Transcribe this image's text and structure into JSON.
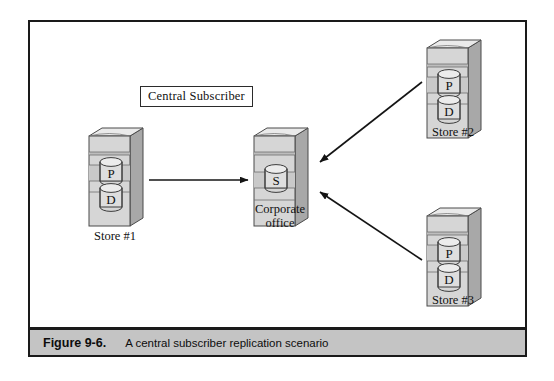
{
  "figure": {
    "caption_number": "Figure 9-6.",
    "caption_title": "A central subscriber replication scenario"
  },
  "diagram": {
    "type": "replication-topology",
    "title_box": "Central Subscriber",
    "colors": {
      "tower_front": "#d6d6d6",
      "tower_top": "#e8e8e8",
      "tower_side": "#a8a8a8",
      "tower_band": "#c3c3c3",
      "disk_face": "#dedede",
      "outline": "#4a4a4a",
      "arrow": "#141414",
      "caption_bar": "#c4c4c4",
      "frame_border": "#1a1a1a"
    },
    "nodes": [
      {
        "id": "store-1",
        "label": "Store #1",
        "role": "publisher",
        "disks": [
          "P",
          "D"
        ],
        "x": 55,
        "y": 100
      },
      {
        "id": "corporate-office",
        "label": "Corporate\noffice",
        "label_line_1": "Corporate",
        "label_line_2": "office",
        "role": "subscriber",
        "disks": [
          "S"
        ],
        "x": 220,
        "y": 100
      },
      {
        "id": "store-2",
        "label": "Store #2",
        "role": "publisher",
        "disks": [
          "P",
          "D"
        ],
        "x": 393,
        "y": 12
      },
      {
        "id": "store-3",
        "label": "Store #3",
        "role": "publisher",
        "disks": [
          "P",
          "D"
        ],
        "x": 393,
        "y": 180
      }
    ],
    "connections": [
      {
        "id": "conn-store1-corporate",
        "from": "store-1",
        "to": "corporate-office",
        "direction": "right"
      },
      {
        "id": "conn-store2-corporate",
        "from": "store-2",
        "to": "corporate-office",
        "direction": "down-left"
      },
      {
        "id": "conn-store3-corporate",
        "from": "store-3",
        "to": "corporate-office",
        "direction": "up-left"
      }
    ],
    "disk_glyphs": {
      "publisher": "P",
      "database": "D",
      "subscriber": "S"
    }
  }
}
